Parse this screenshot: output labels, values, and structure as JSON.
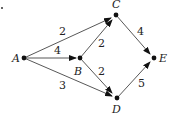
{
  "diagram": {
    "type": "directed-weighted-graph",
    "nodes": [
      {
        "id": "A",
        "label": "A",
        "x": 24,
        "y": 58
      },
      {
        "id": "B",
        "label": "B",
        "x": 80,
        "y": 58
      },
      {
        "id": "C",
        "label": "C",
        "x": 116,
        "y": 15
      },
      {
        "id": "D",
        "label": "D",
        "x": 117,
        "y": 98
      },
      {
        "id": "E",
        "label": "E",
        "x": 154,
        "y": 58
      }
    ],
    "edges": [
      {
        "from": "A",
        "to": "C",
        "weight": "2"
      },
      {
        "from": "A",
        "to": "B",
        "weight": "4"
      },
      {
        "from": "A",
        "to": "D",
        "weight": "3"
      },
      {
        "from": "B",
        "to": "C",
        "weight": "2"
      },
      {
        "from": "B",
        "to": "D",
        "weight": "2"
      },
      {
        "from": "C",
        "to": "E",
        "weight": "4"
      },
      {
        "from": "D",
        "to": "E",
        "weight": "5"
      }
    ]
  }
}
